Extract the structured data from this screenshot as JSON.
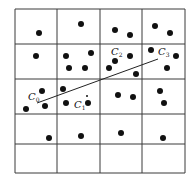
{
  "diagram": {
    "grid": {
      "x_lines": [
        15,
        57,
        100,
        142,
        185
      ],
      "y_lines": [
        9,
        44,
        79,
        114,
        144,
        173
      ],
      "columns": 4,
      "rows": 5,
      "line_color": "#3a3a3a"
    },
    "points": [
      [
        39,
        33
      ],
      [
        81,
        24
      ],
      [
        115,
        30
      ],
      [
        130,
        35
      ],
      [
        155,
        26
      ],
      [
        170,
        33
      ],
      [
        36,
        56
      ],
      [
        66,
        56
      ],
      [
        91,
        53
      ],
      [
        69,
        68
      ],
      [
        85,
        68
      ],
      [
        115,
        61
      ],
      [
        109,
        68
      ],
      [
        130,
        56
      ],
      [
        136,
        74
      ],
      [
        151,
        50
      ],
      [
        176,
        56
      ],
      [
        167,
        68
      ],
      [
        42,
        91
      ],
      [
        26,
        109
      ],
      [
        45,
        106
      ],
      [
        63,
        89
      ],
      [
        66,
        103
      ],
      [
        88,
        103
      ],
      [
        118,
        95
      ],
      [
        133,
        97
      ],
      [
        160,
        91
      ],
      [
        164,
        103
      ],
      [
        49,
        138
      ],
      [
        81,
        136
      ],
      [
        121,
        133
      ],
      [
        163,
        138
      ]
    ],
    "point_radius": 3,
    "point_color": "#111111",
    "segment": {
      "x1": 37,
      "y1": 103,
      "x2": 158,
      "y2": 59
    },
    "marker_point": {
      "x": 87,
      "y": 96,
      "r": 1
    },
    "labels": [
      {
        "id": "C0",
        "base": "C",
        "sub": "0",
        "x": 28,
        "y": 100
      },
      {
        "id": "C1",
        "base": "C",
        "sub": "1",
        "x": 74,
        "y": 108
      },
      {
        "id": "C2",
        "base": "C",
        "sub": "2",
        "x": 111,
        "y": 55
      },
      {
        "id": "C3",
        "base": "C",
        "sub": "3",
        "x": 158,
        "y": 55
      }
    ]
  }
}
